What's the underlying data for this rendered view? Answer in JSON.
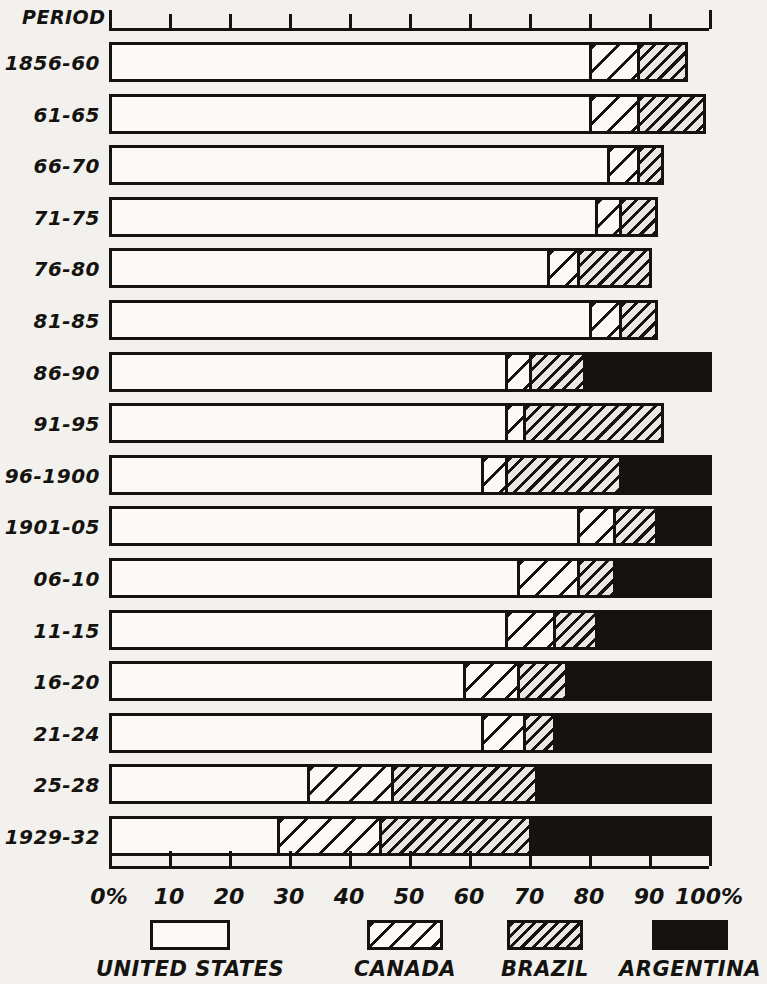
{
  "axis": {
    "period_label": "PERIOD",
    "x_ticks": [
      "0%",
      "10",
      "20",
      "30",
      "40",
      "50",
      "60",
      "70",
      "80",
      "90",
      "100%"
    ],
    "x_tick_values": [
      0,
      10,
      20,
      30,
      40,
      50,
      60,
      70,
      80,
      90,
      100
    ]
  },
  "legend": {
    "items": [
      {
        "name": "united-states",
        "label": "UNITED STATES",
        "pattern": "empty",
        "color": "#fbfaf7"
      },
      {
        "name": "canada",
        "label": "CANADA",
        "pattern": "sparse-hatch",
        "color": "#fbfaf7"
      },
      {
        "name": "brazil",
        "label": "BRAZIL",
        "pattern": "dense-hatch",
        "color": "#e9e8e4"
      },
      {
        "name": "argentina",
        "label": "ARGENTINA",
        "pattern": "solid",
        "color": "#15130f"
      }
    ]
  },
  "chart_data": {
    "type": "bar",
    "orientation": "horizontal",
    "stacked": true,
    "title": "",
    "xlabel": "",
    "ylabel": "PERIOD",
    "xlim": [
      0,
      100
    ],
    "grid": false,
    "legend_position": "bottom",
    "categories": [
      "1856-60",
      "61-65",
      "66-70",
      "71-75",
      "76-80",
      "81-85",
      "86-90",
      "91-95",
      "96-1900",
      "1901-05",
      "06-10",
      "11-15",
      "16-20",
      "21-24",
      "25-28",
      "1929-32"
    ],
    "series": [
      {
        "name": "UNITED STATES",
        "values": [
          80,
          80,
          83,
          81,
          73,
          80,
          66,
          66,
          62,
          78,
          68,
          66,
          59,
          62,
          33,
          28
        ]
      },
      {
        "name": "CANADA",
        "values": [
          8,
          8,
          5,
          4,
          5,
          5,
          4,
          3,
          4,
          6,
          10,
          8,
          9,
          7,
          14,
          17
        ]
      },
      {
        "name": "BRAZIL",
        "values": [
          8,
          11,
          4,
          6,
          12,
          6,
          9,
          23,
          19,
          7,
          6,
          7,
          8,
          5,
          24,
          25
        ]
      },
      {
        "name": "ARGENTINA",
        "values": [
          0,
          0,
          0,
          0,
          0,
          0,
          21,
          0,
          15,
          9,
          16,
          19,
          24,
          26,
          29,
          30
        ]
      }
    ],
    "totals": [
      96,
      99,
      92,
      91,
      90,
      91,
      100,
      92,
      100,
      100,
      100,
      100,
      100,
      100,
      100,
      100
    ]
  }
}
